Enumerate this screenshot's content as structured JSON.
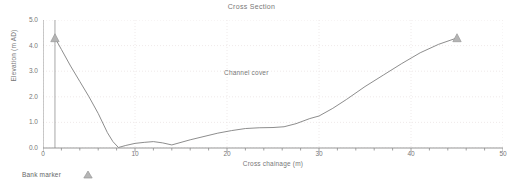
{
  "chart_data": {
    "type": "line",
    "title": "Cross Section",
    "xlabel": "Cross chainage (m)",
    "ylabel": "Elevation (m AD)",
    "xlim": [
      0,
      50
    ],
    "ylim": [
      0.0,
      5.0
    ],
    "xticks": [
      0,
      10,
      20,
      30,
      40,
      50
    ],
    "xtick_labels": [
      "0",
      "10",
      "20",
      "30",
      "40",
      "50"
    ],
    "yticks": [
      0.0,
      1.0,
      2.0,
      3.0,
      4.0,
      5.0
    ],
    "ytick_labels": [
      "0.0",
      "1.0",
      "2.0",
      "3.0",
      "4.0",
      "5.0"
    ],
    "xminor_step": 2,
    "yminor_step": 0.2,
    "grid": true,
    "grid_style": "dotted",
    "grid_color": "#ebe4e4",
    "line_color": "#808080",
    "marker_color": "#9a9a9a",
    "series": [
      {
        "name": "Channel cover",
        "x": [
          1.3,
          2.0,
          3.0,
          4.0,
          5.0,
          6.0,
          7.0,
          7.6,
          8.2,
          9.0,
          10.0,
          11.0,
          12.0,
          13.0,
          14.0,
          15.0,
          16.0,
          17.5,
          19.0,
          20.5,
          22.0,
          23.5,
          25.0,
          26.2,
          27.5,
          29.0,
          30.0,
          31.5,
          33.0,
          35.0,
          37.0,
          39.0,
          41.0,
          43.0,
          45.0
        ],
        "y": [
          4.3,
          3.85,
          3.2,
          2.6,
          2.0,
          1.35,
          0.6,
          0.25,
          0.02,
          0.1,
          0.18,
          0.22,
          0.25,
          0.2,
          0.12,
          0.22,
          0.32,
          0.45,
          0.58,
          0.68,
          0.76,
          0.79,
          0.8,
          0.83,
          0.95,
          1.15,
          1.25,
          1.55,
          1.9,
          2.4,
          2.85,
          3.3,
          3.72,
          4.05,
          4.3
        ]
      }
    ],
    "markers": {
      "name": "Bank marker",
      "points": [
        {
          "x": 1.3,
          "y": 4.3
        },
        {
          "x": 45.0,
          "y": 4.3
        }
      ]
    },
    "vertical_lines": [
      {
        "x": 1.3,
        "y_from": 0.0,
        "y_to": 5.0
      }
    ],
    "annotations": [
      {
        "text": "Channel cover",
        "x": 22.5,
        "y": 2.92
      }
    ],
    "legend": {
      "position": "below-left",
      "entries": [
        {
          "label": "Bank marker",
          "marker": "triangle-up-icon",
          "color": "#9a9a9a"
        }
      ]
    }
  }
}
